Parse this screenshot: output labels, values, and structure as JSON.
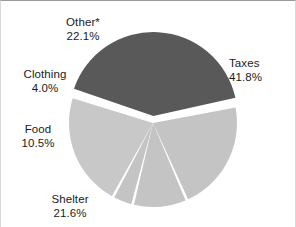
{
  "chart_data": {
    "type": "pie",
    "title": "",
    "subtitle": "",
    "categories": [
      "Taxes",
      "Shelter",
      "Other*",
      "Food",
      "Clothing"
    ],
    "values": [
      41.8,
      21.6,
      22.1,
      10.5,
      4.0
    ],
    "value_suffix": "%",
    "legend_position": "none",
    "grid": false,
    "slices": [
      {
        "label": "Taxes",
        "percent_text": "41.8%",
        "value": 41.8,
        "color": "#595959",
        "exploded": true
      },
      {
        "label": "Shelter",
        "percent_text": "21.6%",
        "value": 21.6,
        "color": "#c4c4c4",
        "exploded": false
      },
      {
        "label": "Food",
        "percent_text": "10.5%",
        "value": 10.5,
        "color": "#c4c4c4",
        "exploded": false
      },
      {
        "label": "Clothing",
        "percent_text": "4.0%",
        "value": 4.0,
        "color": "#c4c4c4",
        "exploded": false
      },
      {
        "label": "Other*",
        "percent_text": "22.1%",
        "value": 22.1,
        "color": "#c8c8c8",
        "exploded": false
      }
    ],
    "xlabel": "",
    "ylabel": ""
  },
  "labels": {
    "other": {
      "name": "Other*",
      "percent": "22.1%"
    },
    "clothing": {
      "name": "Clothing",
      "percent": "4.0%"
    },
    "food": {
      "name": "Food",
      "percent": "10.5%"
    },
    "shelter": {
      "name": "Shelter",
      "percent": "21.6%"
    },
    "taxes": {
      "name": "Taxes",
      "percent": "41.8%"
    }
  },
  "colors": {
    "slice_dark": "#595959",
    "slice_light": "#c4c4c4",
    "slice_light_alt": "#c8c8c8",
    "background": "#ffffff",
    "separator": "#ffffff",
    "text": "#1b1b1b",
    "border": "#9a9a9a"
  }
}
